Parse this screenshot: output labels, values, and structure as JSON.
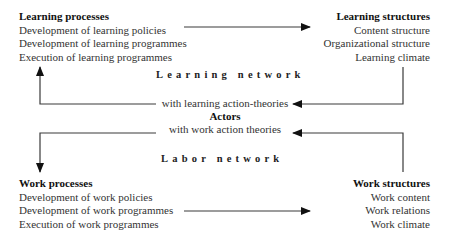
{
  "learning_processes": {
    "title": "Learning processes",
    "items": [
      "Development of learning policies",
      "Development of learning programmes",
      "Execution of learning programmes"
    ]
  },
  "learning_structures": {
    "title": "Learning structures",
    "items": [
      "Content structure",
      "Organizational structure",
      "Learning climate"
    ]
  },
  "learning_network": "Learning network",
  "actors": {
    "line1": "with learning action-theories",
    "title": "Actors",
    "line2": "with work action theories"
  },
  "labor_network": "Labor network",
  "work_processes": {
    "title": "Work processes",
    "items": [
      "Development of work policies",
      "Development of work programmes",
      "Execution of work programmes"
    ]
  },
  "work_structures": {
    "title": "Work structures",
    "items": [
      "Work content",
      "Work relations",
      "Work climate"
    ]
  },
  "colors": {
    "line": "#3a3a3a",
    "text": "#222222"
  }
}
